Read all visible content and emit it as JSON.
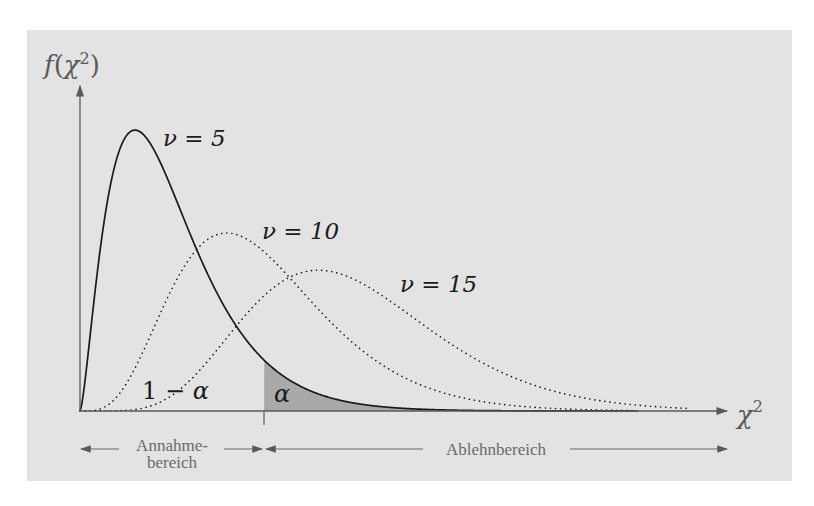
{
  "chart_data": {
    "type": "line",
    "title": "",
    "xlabel": "χ²",
    "ylabel": "f(χ²)",
    "series": [
      {
        "name": "ν = 5",
        "df": 5,
        "style": "solid",
        "mode_x": 3,
        "peak_density": 0.154
      },
      {
        "name": "ν = 10",
        "df": 10,
        "style": "dotted",
        "mode_x": 8,
        "peak_density": 0.098
      },
      {
        "name": "ν = 15",
        "df": 15,
        "style": "dotted",
        "mode_x": 13,
        "peak_density": 0.078
      }
    ],
    "critical_value_x": 10.05,
    "xlim": [
      0,
      35
    ],
    "annotations": [
      {
        "text": "1 − α",
        "meaning": "acceptance probability area"
      },
      {
        "text": "α",
        "meaning": "shaded rejection tail area"
      }
    ],
    "regions": [
      {
        "label": "Annahmebereich",
        "from": 0,
        "to": 10.05
      },
      {
        "label": "Ablehnbereich",
        "from": 10.05,
        "to": 35
      }
    ],
    "grid": false,
    "legend": "inline labels"
  },
  "labels": {
    "y_axis_f": "f",
    "y_axis_open": "(",
    "y_axis_chi": "χ",
    "y_axis_sup": "2",
    "y_axis_close": ")",
    "x_axis_chi": "χ",
    "x_axis_sup": "2",
    "nu5": "ν = 5",
    "nu10": "ν = 10",
    "nu15": "ν = 15",
    "one": "1 − ",
    "alpha_main": "α",
    "alpha_tail": "α",
    "accept_line1": "Annahme-",
    "accept_line2": "bereich",
    "reject": "Ablehnbereich"
  },
  "colors": {
    "background": "#e3e3e3",
    "tail_fill": "#a9a9a9",
    "curve": "#1a1a1a",
    "axis": "#5a5a5a"
  }
}
